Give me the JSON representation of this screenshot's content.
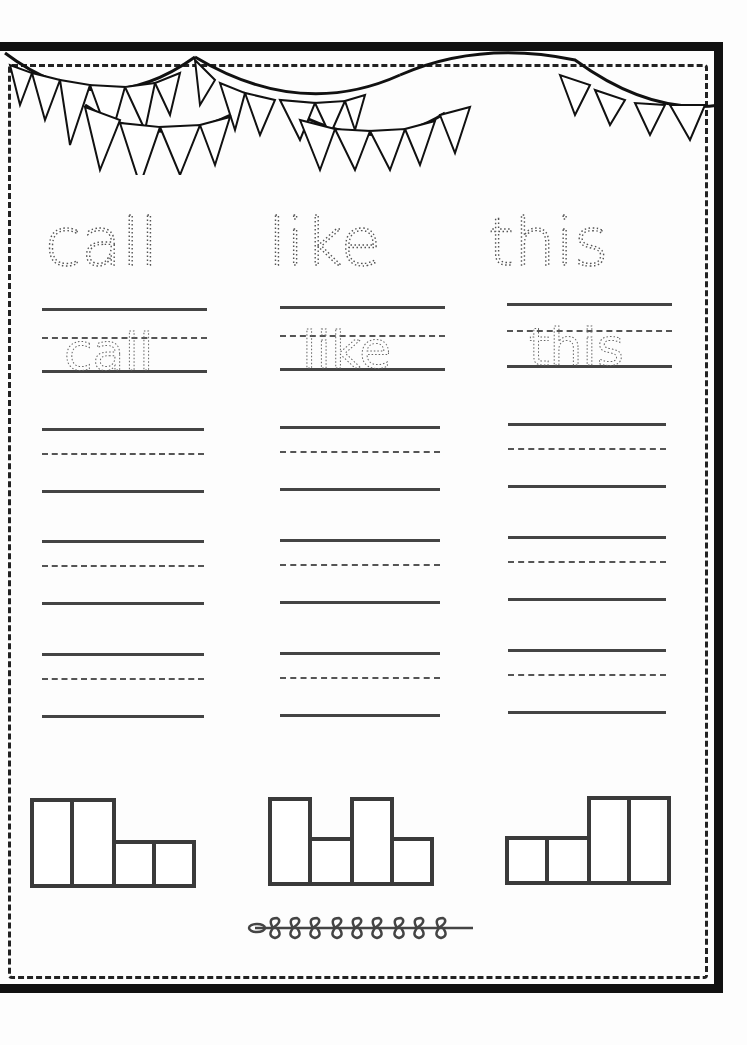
{
  "worksheet": {
    "type": "sight word tracing worksheet",
    "colors": {
      "border": "#111111",
      "lines": "#444444",
      "trace_dots": "#555555"
    },
    "words": [
      {
        "word": "call",
        "trace_text": "call",
        "practice_rows": 3,
        "word_shape": [
          2,
          2,
          1,
          1
        ]
      },
      {
        "word": "like",
        "trace_text": "like",
        "practice_rows": 3,
        "word_shape": [
          2,
          1,
          2,
          1
        ]
      },
      {
        "word": "this",
        "trace_text": "this",
        "practice_rows": 3,
        "word_shape": [
          1,
          1,
          2,
          2
        ]
      }
    ],
    "decorations": {
      "top": "bunting-banner",
      "bottom": "leaf-sprig"
    }
  }
}
